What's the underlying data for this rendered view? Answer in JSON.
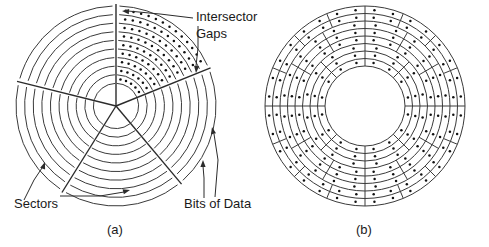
{
  "figure": {
    "background_color": "#ffffff",
    "line_color": "#3a3a3a",
    "accent_line_color": "#2b2b2b",
    "dot_color": "#111111",
    "labels": {
      "intersector_gaps_line1": "Intersector",
      "intersector_gaps_line2": "Gaps",
      "sectors": "Sectors",
      "bits_of_data": "Bits of Data"
    },
    "captions": {
      "left": "(a)",
      "right": "(b)"
    },
    "panel_a": {
      "name": "constant-angular-velocity-disk",
      "center_x": 116,
      "center_y": 106,
      "outer_radius": 100,
      "track_count": 10,
      "inner_radius": 14,
      "sector_count": 5,
      "sector_angles_deg": [
        -90,
        -22,
        50,
        122,
        194
      ],
      "bits_sector_index": 0,
      "bits_per_track": [
        4,
        5,
        6,
        7,
        8,
        9,
        10,
        11,
        12,
        13
      ]
    },
    "panel_b": {
      "name": "zoned-bit-recording-disk",
      "center_x": 365,
      "center_y": 106,
      "outer_radius": 100,
      "inner_radius": 40,
      "track_count": 8,
      "zones": [
        {
          "tracks": [
            0,
            1,
            2
          ],
          "sector_count": 8,
          "start_angle_deg": -90
        },
        {
          "tracks": [
            3,
            4,
            5
          ],
          "sector_count": 12,
          "start_angle_deg": -90
        },
        {
          "tracks": [
            6,
            7
          ],
          "sector_count": 16,
          "start_angle_deg": -90
        }
      ],
      "bits_per_sector": 2
    }
  }
}
